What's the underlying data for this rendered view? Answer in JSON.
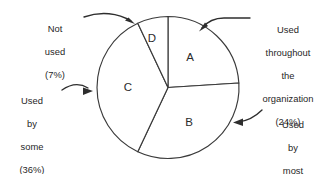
{
  "chart_data": {
    "type": "pie",
    "title": "",
    "subtitle": "",
    "xlabel": "",
    "ylabel": "",
    "legend_position": "callouts",
    "grid": false,
    "categories": [
      "A",
      "B",
      "C",
      "D"
    ],
    "values": [
      24,
      33,
      36,
      7
    ],
    "units": "percent",
    "start_angle_deg": 0,
    "direction": "clockwise",
    "slices": [
      {
        "key": "A",
        "slice_label": "A",
        "value": 24,
        "value_label": "(24%)",
        "callout": "Used throughout the organization",
        "callout_lines": [
          "Used",
          "throughout",
          "the",
          "organization",
          "(24%)"
        ]
      },
      {
        "key": "B",
        "slice_label": "B",
        "value": 33,
        "value_label": "(33%)",
        "callout": "Used by most",
        "callout_lines": [
          "Used",
          "by",
          "most",
          "(33%)"
        ]
      },
      {
        "key": "C",
        "slice_label": "C",
        "value": 36,
        "value_label": "(36%)",
        "callout": "Used by some",
        "callout_lines": [
          "Used",
          "by",
          "some",
          "(36%)"
        ]
      },
      {
        "key": "D",
        "slice_label": "D",
        "value": 7,
        "value_label": "(7%)",
        "callout": "Not used",
        "callout_lines": [
          "Not",
          "used",
          "(7%)"
        ]
      }
    ],
    "colors": {
      "slice_fill": "#ffffff",
      "slice_stroke": "#3a3a3a",
      "text": "#1f1f1f",
      "leader": "#2e2e2e",
      "background": "#ffffff"
    }
  },
  "callouts": {
    "not_used": {
      "line1": "Not",
      "line2": "used",
      "line3": "(7%)"
    },
    "throughout": {
      "line1": "Used",
      "line2": "throughout",
      "line3": "the",
      "line4": "organization",
      "line5": "(24%)"
    },
    "most": {
      "line1": "Used",
      "line2": "by",
      "line3": "most",
      "line4": "(33%)"
    },
    "some": {
      "line1": "Used",
      "line2": "by",
      "line3": "some",
      "line4": "(36%)"
    }
  },
  "slice_letters": {
    "a": "A",
    "b": "B",
    "c": "C",
    "d": "D"
  }
}
